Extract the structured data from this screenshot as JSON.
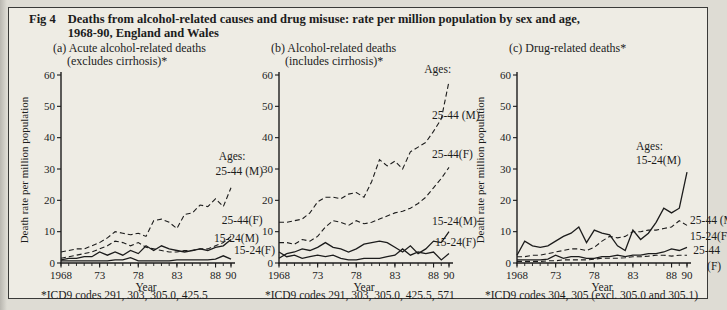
{
  "page": {
    "background": "#dedcd4",
    "box_background": "#eeece4",
    "ink": "#1c1c1c"
  },
  "figure": {
    "label": "Fig 4",
    "title_line1": "Deaths from alcohol-related causes and drug misuse: rate per million population by sex and age,",
    "title_line2": "1968-90, England and Wales"
  },
  "chart_data": [
    {
      "id": "a",
      "type": "line",
      "title": "(a) Acute alcohol-related deaths",
      "subtitle": "(excludes cirrhosis)*",
      "ylabel": "Death rate per million population",
      "xlabel": "Year",
      "footnote": "*ICD9 codes 291, 303, 305.0, 425.5",
      "x_start": 1968,
      "x_end": 1990,
      "ylim": [
        0,
        60
      ],
      "yticks": [
        0,
        10,
        20,
        30,
        40,
        50,
        60
      ],
      "xticks": [
        {
          "x": 1968,
          "label": "1968"
        },
        {
          "x": 1973,
          "label": "73"
        },
        {
          "x": 1978,
          "label": "78"
        },
        {
          "x": 1983,
          "label": "83"
        },
        {
          "x": 1988,
          "label": "88"
        },
        {
          "x": 1990,
          "label": "90"
        }
      ],
      "series": [
        {
          "name": "25-44 (M)",
          "style": "dashed",
          "values": [
            3.5,
            4,
            4.5,
            4.5,
            5.5,
            6.5,
            8,
            10,
            9.5,
            9,
            9.5,
            8.5,
            13.5,
            14,
            13,
            11,
            15.5,
            16,
            18.5,
            18,
            20.5,
            18,
            24
          ]
        },
        {
          "name": "25-44 (F)",
          "style": "dashed",
          "values": [
            1.5,
            2,
            2.5,
            3,
            3.5,
            4.5,
            5.5,
            7,
            6.5,
            5.5,
            6.5,
            5,
            4.5,
            4,
            3.5,
            3.5,
            4,
            4,
            4.5,
            4.5,
            5.5,
            6.5,
            8.5
          ]
        },
        {
          "name": "15-24 (M)",
          "style": "solid",
          "values": [
            1,
            1.5,
            1.5,
            2,
            2,
            3.5,
            2.5,
            3.5,
            2.5,
            4,
            3,
            5.5,
            4,
            5.5,
            4.5,
            4,
            3.5,
            4,
            4.5,
            4,
            5,
            5.5,
            7.5
          ]
        },
        {
          "name": "15-24 (F)",
          "style": "solid",
          "values": [
            0.7,
            0.7,
            0.7,
            0.7,
            0.7,
            0.7,
            0.7,
            1,
            1,
            1.7,
            0.7,
            0.7,
            0.7,
            0.7,
            0.7,
            1,
            1,
            1,
            1,
            1,
            1.2,
            2.3,
            1.2
          ]
        }
      ],
      "annotations": [
        {
          "text": "Ages:",
          "x": 1988.4,
          "y": 33
        },
        {
          "text": "25-44 (M)",
          "x": 1988.0,
          "y": 28
        },
        {
          "text": "25-44(F)",
          "x": 1988.8,
          "y": 12.5
        },
        {
          "text": "15-24(M)",
          "x": 1987.8,
          "y": 6.8
        },
        {
          "text": "15-24(F)",
          "x": 1990.4,
          "y": 3.0
        }
      ]
    },
    {
      "id": "b",
      "type": "line",
      "title": "(b) Alcohol-related deaths",
      "subtitle": "(includes cirrhosis)*",
      "xlabel": "Year",
      "footnote": "*ICD9 codes 291, 303, 305.0, 425.5, 571",
      "x_start": 1968,
      "x_end": 1990,
      "ylim": [
        0,
        60
      ],
      "yticks": [
        0,
        10,
        20,
        30,
        40,
        50,
        60
      ],
      "xticks": [
        {
          "x": 1968,
          "label": "1968"
        },
        {
          "x": 1973,
          "label": "73"
        },
        {
          "x": 1978,
          "label": "78"
        },
        {
          "x": 1983,
          "label": "83"
        },
        {
          "x": 1988,
          "label": "88"
        },
        {
          "x": 1990,
          "label": "90"
        }
      ],
      "series": [
        {
          "name": "25-44 (M)",
          "style": "dashed",
          "values": [
            13,
            13,
            13.5,
            14,
            16,
            19.5,
            21,
            21,
            20.5,
            22,
            22.5,
            21,
            26,
            33,
            31,
            32.5,
            30,
            35.5,
            37,
            38.5,
            42,
            46,
            58
          ]
        },
        {
          "name": "25-44 (F)",
          "style": "dashed",
          "values": [
            6.5,
            6.5,
            6,
            7.5,
            7,
            8.5,
            11.5,
            13.5,
            13,
            12,
            13.5,
            12.5,
            13,
            14,
            15,
            16,
            16.5,
            17.5,
            19,
            21,
            24,
            27,
            30.5
          ]
        },
        {
          "name": "15-24 (M)",
          "style": "solid",
          "values": [
            1.5,
            3,
            3.5,
            4.5,
            4,
            5,
            6.5,
            5,
            4.5,
            3.5,
            4.5,
            6,
            6.5,
            7,
            6.5,
            5,
            3.5,
            5.5,
            3,
            4.5,
            7,
            6.5,
            10
          ]
        },
        {
          "name": "15-24 (F)",
          "style": "solid",
          "values": [
            3.5,
            2,
            2.5,
            1.5,
            2,
            2.5,
            2,
            2.5,
            1.5,
            1,
            1,
            1.5,
            1.5,
            1.5,
            2,
            2.5,
            4.5,
            2.5,
            3.5,
            3,
            3.5,
            1,
            3
          ]
        }
      ],
      "annotations": [
        {
          "text": "Ages:",
          "x": 1986.8,
          "y": 60.5
        },
        {
          "text": "25-44 (M)",
          "x": 1987.8,
          "y": 46
        },
        {
          "text": "25-44(F)",
          "x": 1987.8,
          "y": 33.5
        },
        {
          "text": "15-24(M)",
          "x": 1987.8,
          "y": 12
        },
        {
          "text": "15-24(F)",
          "x": 1988.2,
          "y": 5.5
        }
      ]
    },
    {
      "id": "c",
      "type": "line",
      "title": "(c) Drug-related deaths*",
      "subtitle": "",
      "ylabel": "Death rate per million population",
      "xlabel": "Year",
      "footnote": "*ICD9 codes 304, 305 (excl. 305.0 and 305.1)",
      "x_start": 1968,
      "x_end": 1990,
      "ylim": [
        0,
        60
      ],
      "yticks": [
        0,
        10,
        20,
        30,
        40,
        50,
        60
      ],
      "xticks": [
        {
          "x": 1968,
          "label": "1968"
        },
        {
          "x": 1973,
          "label": "73"
        },
        {
          "x": 1978,
          "label": "78"
        },
        {
          "x": 1983,
          "label": "83"
        },
        {
          "x": 1988,
          "label": "88"
        },
        {
          "x": 1990,
          "label": "90"
        }
      ],
      "series": [
        {
          "name": "15-24 (M)",
          "style": "solid",
          "values": [
            2.5,
            7,
            5.5,
            5,
            5.5,
            7,
            8.5,
            9.5,
            11.5,
            6.5,
            10.5,
            9.5,
            9,
            5.5,
            4,
            10.5,
            7.5,
            9.5,
            13,
            17.5,
            16,
            17.5,
            29
          ]
        },
        {
          "name": "25-44 (M)",
          "style": "dashed",
          "values": [
            2,
            2,
            2.5,
            2.5,
            3,
            3.5,
            4,
            4.5,
            4.5,
            4,
            5,
            7,
            8.5,
            8,
            8.5,
            10,
            10,
            10.5,
            10.5,
            11,
            11.5,
            13.5,
            12
          ]
        },
        {
          "name": "15-24 (F)",
          "style": "solid",
          "values": [
            1,
            1,
            1,
            1,
            1.2,
            2.5,
            1.5,
            2,
            2,
            1.5,
            1.5,
            2,
            2,
            2.5,
            2,
            2.5,
            2.5,
            3,
            3,
            3.5,
            4.5,
            4,
            5
          ]
        },
        {
          "name": "25-44 (F)",
          "style": "dashed",
          "values": [
            0.5,
            0.5,
            0.5,
            0.5,
            0.7,
            0.7,
            1,
            1,
            1,
            1,
            1.2,
            1.5,
            1.5,
            1.5,
            1.7,
            2,
            2,
            2.2,
            2.5,
            2.5,
            2.2,
            2.5,
            2.5
          ]
        }
      ],
      "annotations": [
        {
          "text": "Ages:",
          "x": 1983.4,
          "y": 36
        },
        {
          "text": "15-24(M)",
          "x": 1983.4,
          "y": 31.5
        },
        {
          "text": "25-44 (M)",
          "x": 1990.4,
          "y": 12.5
        },
        {
          "text": "15-24(F)",
          "x": 1990.4,
          "y": 7.5
        },
        {
          "text": "25-44",
          "x": 1990.8,
          "y": 3.0
        },
        {
          "text": "(F)",
          "x": 1992.6,
          "y": -2.2
        }
      ]
    }
  ]
}
